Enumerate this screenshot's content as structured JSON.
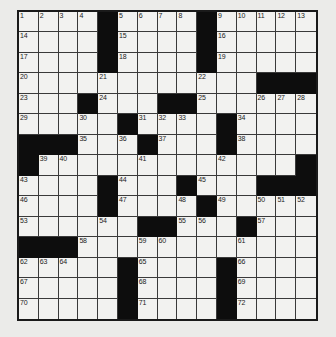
{
  "puzzle": {
    "rows": 15,
    "cols": 15,
    "colors": {
      "background": "#ebebe9",
      "cell": "#f2f2f0",
      "block": "#0d0d0d",
      "grid_line": "#3a3a3a"
    },
    "grid": [
      [
        "1",
        "2",
        "3",
        "4",
        "#",
        "5",
        "6",
        "7",
        "8",
        "#",
        "9",
        "10",
        "11",
        "12",
        "13"
      ],
      [
        "14",
        "",
        "",
        "",
        "#",
        "15",
        "",
        "",
        "",
        "#",
        "16",
        "",
        "",
        "",
        ""
      ],
      [
        "17",
        "",
        "",
        "",
        "#",
        "18",
        "",
        "",
        "",
        "#",
        "19",
        "",
        "",
        "",
        ""
      ],
      [
        "20",
        "",
        "",
        "",
        "21",
        "",
        "",
        "",
        "",
        "22",
        "",
        "",
        "#",
        "#",
        "#"
      ],
      [
        "23",
        "",
        "",
        "#",
        "24",
        "",
        "",
        "#",
        "#",
        "25",
        "",
        "",
        "26",
        "27",
        "28"
      ],
      [
        "29",
        "",
        "",
        "30",
        "",
        "#",
        "31",
        "32",
        "33",
        "",
        "#",
        "34",
        "",
        "",
        ""
      ],
      [
        "#",
        "#",
        "#",
        "35",
        "",
        "36",
        "#",
        "37",
        "",
        "",
        "#",
        "38",
        "",
        "",
        ""
      ],
      [
        "#",
        "39",
        "40",
        "",
        "",
        "",
        "41",
        "",
        "",
        "",
        "42",
        "",
        "",
        "",
        "#"
      ],
      [
        "43",
        "",
        "",
        "",
        "#",
        "44",
        "",
        "",
        "#",
        "45",
        "",
        "",
        "#",
        "#",
        "#"
      ],
      [
        "46",
        "",
        "",
        "",
        "#",
        "47",
        "",
        "",
        "48",
        "#",
        "49",
        "",
        "50",
        "51",
        "52"
      ],
      [
        "53",
        "",
        "",
        "",
        "54",
        "",
        "#",
        "#",
        "55",
        "56",
        "",
        "#",
        "57",
        "",
        ""
      ],
      [
        "#",
        "#",
        "#",
        "58",
        "",
        "",
        "59",
        "60",
        "",
        "",
        "",
        "61",
        "",
        "",
        ""
      ],
      [
        "62",
        "63",
        "64",
        "",
        "",
        "#",
        "65",
        "",
        "",
        "",
        "#",
        "66",
        "",
        "",
        ""
      ],
      [
        "67",
        "",
        "",
        "",
        "",
        "#",
        "68",
        "",
        "",
        "",
        "#",
        "69",
        "",
        "",
        ""
      ],
      [
        "70",
        "",
        "",
        "",
        "",
        "#",
        "71",
        "",
        "",
        "",
        "#",
        "72",
        "",
        "",
        ""
      ]
    ]
  }
}
